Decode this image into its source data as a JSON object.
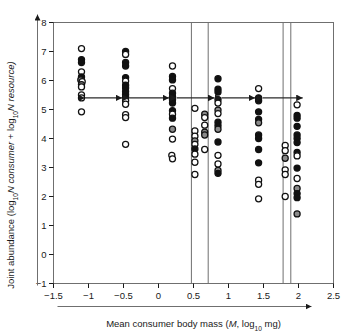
{
  "chart_data": {
    "type": "scatter",
    "title": "",
    "xlabel": "Mean consumer body mass (M, log10 mg)",
    "ylabel": "Joint abundance (log10N consumer + log10N resource)",
    "xlim": [
      -1.5,
      2.5
    ],
    "ylim": [
      -1,
      8
    ],
    "xticks": [
      -1.5,
      -1,
      -0.5,
      0,
      0.5,
      1,
      1.5,
      2,
      2.5
    ],
    "xticklabels": [
      "−1.5",
      "−1",
      "−0.5",
      "0",
      "0.5",
      "1",
      "1.5",
      "2",
      "2.5"
    ],
    "yticks": [
      -1,
      0,
      1,
      2,
      3,
      4,
      5,
      6,
      7,
      8
    ],
    "yticklabels": [
      "−1",
      "0",
      "1",
      "2",
      "3",
      "4",
      "5",
      "6",
      "7",
      "8"
    ],
    "grid": false,
    "legend": null,
    "marker_shape": "circle",
    "marker_styles": {
      "filled": "#111111",
      "open": "#ffffff",
      "edge": "#111111",
      "grey": "#8a8a8a"
    },
    "series": [
      {
        "name": "cluster-1",
        "x_center": -1.1,
        "points": [
          {
            "x": -1.1,
            "y": 7.1,
            "fill": "open"
          },
          {
            "x": -1.1,
            "y": 6.72,
            "fill": "filled"
          },
          {
            "x": -1.1,
            "y": 6.62,
            "fill": "filled"
          },
          {
            "x": -1.1,
            "y": 6.3,
            "fill": "open"
          },
          {
            "x": -1.1,
            "y": 6.12,
            "fill": "filled"
          },
          {
            "x": -1.11,
            "y": 6.02,
            "fill": "grey"
          },
          {
            "x": -1.09,
            "y": 5.96,
            "fill": "open"
          },
          {
            "x": -1.1,
            "y": 5.86,
            "fill": "grey"
          },
          {
            "x": -1.1,
            "y": 5.78,
            "fill": "open"
          },
          {
            "x": -1.1,
            "y": 5.5,
            "fill": "open"
          },
          {
            "x": -1.1,
            "y": 5.4,
            "fill": "open"
          },
          {
            "x": -1.1,
            "y": 4.92,
            "fill": "open"
          }
        ]
      },
      {
        "name": "cluster-2",
        "x_center": -0.47,
        "points": [
          {
            "x": -0.47,
            "y": 7.0,
            "fill": "filled"
          },
          {
            "x": -0.47,
            "y": 6.9,
            "fill": "open"
          },
          {
            "x": -0.47,
            "y": 6.62,
            "fill": "filled"
          },
          {
            "x": -0.47,
            "y": 6.5,
            "fill": "filled"
          },
          {
            "x": -0.47,
            "y": 6.1,
            "fill": "filled"
          },
          {
            "x": -0.47,
            "y": 5.98,
            "fill": "open"
          },
          {
            "x": -0.47,
            "y": 5.84,
            "fill": "filled"
          },
          {
            "x": -0.47,
            "y": 5.74,
            "fill": "filled"
          },
          {
            "x": -0.47,
            "y": 5.62,
            "fill": "filled"
          },
          {
            "x": -0.47,
            "y": 5.52,
            "fill": "filled"
          },
          {
            "x": -0.47,
            "y": 5.42,
            "fill": "filled"
          },
          {
            "x": -0.47,
            "y": 5.3,
            "fill": "open"
          },
          {
            "x": -0.47,
            "y": 5.18,
            "fill": "open"
          },
          {
            "x": -0.47,
            "y": 4.82,
            "fill": "open"
          },
          {
            "x": -0.47,
            "y": 4.72,
            "fill": "open"
          },
          {
            "x": -0.47,
            "y": 3.8,
            "fill": "open"
          }
        ]
      },
      {
        "name": "cluster-3",
        "x_center": 0.2,
        "points": [
          {
            "x": 0.2,
            "y": 6.5,
            "fill": "open"
          },
          {
            "x": 0.2,
            "y": 6.14,
            "fill": "filled"
          },
          {
            "x": 0.2,
            "y": 6.02,
            "fill": "filled"
          },
          {
            "x": 0.2,
            "y": 5.72,
            "fill": "open"
          },
          {
            "x": 0.2,
            "y": 5.56,
            "fill": "filled"
          },
          {
            "x": 0.2,
            "y": 5.44,
            "fill": "filled"
          },
          {
            "x": 0.2,
            "y": 5.34,
            "fill": "filled"
          },
          {
            "x": 0.2,
            "y": 5.22,
            "fill": "filled"
          },
          {
            "x": 0.2,
            "y": 4.96,
            "fill": "filled"
          },
          {
            "x": 0.2,
            "y": 4.84,
            "fill": "open"
          },
          {
            "x": 0.2,
            "y": 4.7,
            "fill": "filled"
          },
          {
            "x": 0.2,
            "y": 4.32,
            "fill": "grey"
          },
          {
            "x": 0.2,
            "y": 3.98,
            "fill": "open"
          },
          {
            "x": 0.19,
            "y": 3.42,
            "fill": "open"
          },
          {
            "x": 0.2,
            "y": 3.3,
            "fill": "open"
          }
        ]
      },
      {
        "name": "cluster-4",
        "x_center": 0.52,
        "points": [
          {
            "x": 0.52,
            "y": 5.04,
            "fill": "open"
          },
          {
            "x": 0.52,
            "y": 4.26,
            "fill": "open"
          },
          {
            "x": 0.52,
            "y": 4.08,
            "fill": "open"
          },
          {
            "x": 0.52,
            "y": 3.92,
            "fill": "grey"
          },
          {
            "x": 0.52,
            "y": 3.8,
            "fill": "open"
          },
          {
            "x": 0.52,
            "y": 3.64,
            "fill": "filled"
          },
          {
            "x": 0.52,
            "y": 3.46,
            "fill": "open"
          },
          {
            "x": 0.52,
            "y": 3.18,
            "fill": "open"
          },
          {
            "x": 0.52,
            "y": 2.76,
            "fill": "open"
          }
        ]
      },
      {
        "name": "cluster-5",
        "x_center": 0.66,
        "points": [
          {
            "x": 0.66,
            "y": 4.84,
            "fill": "grey"
          },
          {
            "x": 0.66,
            "y": 4.72,
            "fill": "open"
          },
          {
            "x": 0.66,
            "y": 4.46,
            "fill": "open"
          },
          {
            "x": 0.66,
            "y": 4.22,
            "fill": "grey"
          },
          {
            "x": 0.66,
            "y": 4.12,
            "fill": "grey"
          },
          {
            "x": 0.66,
            "y": 3.62,
            "fill": "open"
          }
        ]
      },
      {
        "name": "cluster-6",
        "x_center": 0.85,
        "points": [
          {
            "x": 0.85,
            "y": 6.06,
            "fill": "filled"
          },
          {
            "x": 0.85,
            "y": 5.7,
            "fill": "filled"
          },
          {
            "x": 0.85,
            "y": 5.6,
            "fill": "filled"
          },
          {
            "x": 0.85,
            "y": 5.34,
            "fill": "filled"
          },
          {
            "x": 0.85,
            "y": 5.22,
            "fill": "open"
          },
          {
            "x": 0.85,
            "y": 4.98,
            "fill": "grey"
          },
          {
            "x": 0.85,
            "y": 4.86,
            "fill": "open"
          },
          {
            "x": 0.85,
            "y": 4.56,
            "fill": "filled"
          },
          {
            "x": 0.85,
            "y": 4.44,
            "fill": "filled"
          },
          {
            "x": 0.85,
            "y": 4.32,
            "fill": "grey"
          },
          {
            "x": 0.85,
            "y": 3.88,
            "fill": "filled"
          },
          {
            "x": 0.85,
            "y": 3.42,
            "fill": "open"
          },
          {
            "x": 0.85,
            "y": 3.12,
            "fill": "open"
          },
          {
            "x": 0.85,
            "y": 2.9,
            "fill": "grey"
          },
          {
            "x": 0.85,
            "y": 2.8,
            "fill": "filled"
          }
        ]
      },
      {
        "name": "cluster-7",
        "x_center": 1.43,
        "points": [
          {
            "x": 1.43,
            "y": 5.72,
            "fill": "open"
          },
          {
            "x": 1.43,
            "y": 5.4,
            "fill": "filled"
          },
          {
            "x": 1.43,
            "y": 5.3,
            "fill": "filled"
          },
          {
            "x": 1.43,
            "y": 4.92,
            "fill": "filled"
          },
          {
            "x": 1.43,
            "y": 4.66,
            "fill": "filled"
          },
          {
            "x": 1.43,
            "y": 4.54,
            "fill": "grey"
          },
          {
            "x": 1.43,
            "y": 4.12,
            "fill": "filled"
          },
          {
            "x": 1.43,
            "y": 4.0,
            "fill": "filled"
          },
          {
            "x": 1.43,
            "y": 3.62,
            "fill": "filled"
          },
          {
            "x": 1.43,
            "y": 3.16,
            "fill": "filled"
          },
          {
            "x": 1.43,
            "y": 2.56,
            "fill": "open"
          },
          {
            "x": 1.43,
            "y": 2.42,
            "fill": "open"
          },
          {
            "x": 1.43,
            "y": 1.92,
            "fill": "open"
          }
        ]
      },
      {
        "name": "cluster-8",
        "x_center": 1.81,
        "points": [
          {
            "x": 1.81,
            "y": 3.76,
            "fill": "open"
          },
          {
            "x": 1.81,
            "y": 3.58,
            "fill": "open"
          },
          {
            "x": 1.81,
            "y": 3.32,
            "fill": "grey"
          },
          {
            "x": 1.81,
            "y": 2.92,
            "fill": "open"
          },
          {
            "x": 1.81,
            "y": 2.76,
            "fill": "open"
          },
          {
            "x": 1.81,
            "y": 2.0,
            "fill": "open"
          }
        ]
      },
      {
        "name": "cluster-9",
        "x_center": 1.98,
        "points": [
          {
            "x": 1.98,
            "y": 5.16,
            "fill": "open"
          },
          {
            "x": 1.98,
            "y": 4.8,
            "fill": "filled"
          },
          {
            "x": 1.98,
            "y": 4.7,
            "fill": "filled"
          },
          {
            "x": 1.98,
            "y": 4.42,
            "fill": "filled"
          },
          {
            "x": 1.98,
            "y": 4.12,
            "fill": "filled"
          },
          {
            "x": 1.98,
            "y": 4.0,
            "fill": "filled"
          },
          {
            "x": 1.98,
            "y": 3.86,
            "fill": "filled"
          },
          {
            "x": 1.98,
            "y": 3.52,
            "fill": "filled"
          },
          {
            "x": 1.98,
            "y": 3.4,
            "fill": "open"
          },
          {
            "x": 1.98,
            "y": 2.98,
            "fill": "filled"
          },
          {
            "x": 1.98,
            "y": 2.62,
            "fill": "open"
          },
          {
            "x": 1.98,
            "y": 2.28,
            "fill": "grey"
          },
          {
            "x": 1.98,
            "y": 2.1,
            "fill": "filled"
          },
          {
            "x": 1.98,
            "y": 1.96,
            "fill": "filled"
          },
          {
            "x": 1.98,
            "y": 1.4,
            "fill": "grey"
          }
        ]
      }
    ],
    "vertical_lines": [
      0.47,
      0.71,
      1.78,
      1.89
    ],
    "annotations": [
      {
        "type": "double-arrow",
        "y": 5.4,
        "x_start": -1.05,
        "x_end": -0.52
      },
      {
        "type": "double-arrow",
        "y": 5.4,
        "x_start": -0.42,
        "x_end": 0.15
      },
      {
        "type": "double-arrow",
        "y": 5.4,
        "x_start": 0.26,
        "x_end": 0.8
      },
      {
        "type": "double-arrow",
        "y": 5.4,
        "x_start": 0.9,
        "x_end": 1.38
      },
      {
        "type": "double-arrow",
        "y": 5.4,
        "x_start": 1.49,
        "x_end": 2.06
      }
    ]
  },
  "axes": {
    "y_label_parts": {
      "p1": "Joint abundance (log",
      "p1sub": "10",
      "p2": "N",
      "p3": " consumer",
      "p4": " + log",
      "p4sub": "10",
      "p5": "N",
      "p6": " resource)"
    },
    "x_label_parts": {
      "p1": "Mean consumer body mass (",
      "p2": "M",
      "p3": ", log",
      "p3sub": "10",
      "p4": " mg)"
    }
  }
}
